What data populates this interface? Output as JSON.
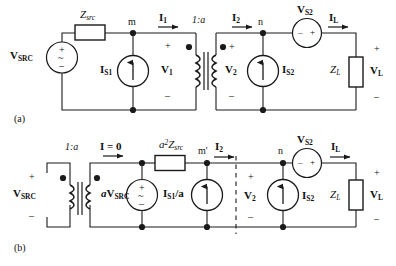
{
  "figure": {
    "type": "circuit-diagram",
    "background_color": "#ffffff",
    "line_color": "#1a1a1a",
    "panels": [
      {
        "caption": "(a)",
        "name": "panel-a",
        "description": "Original two-winding circuit with transformer turns ratio 1:a separating primary and secondary sides"
      },
      {
        "caption": "(b)",
        "name": "panel-b",
        "description": "Referred circuit after reflecting the source side through the 1:a transformer"
      }
    ]
  },
  "panel_a": {
    "caption": "(a)",
    "source_label": "V",
    "source_sub": "SRC",
    "source_symbols": {
      "plus": "+",
      "wave": "~",
      "minus": "–"
    },
    "z_src_label": "Z",
    "z_src_sub": "src",
    "node_m": "m",
    "current_i1": "I",
    "current_i1_sub": "1",
    "is1_label": "I",
    "is1_sub": "S1",
    "v1_label": "V",
    "v1_sub": "1",
    "v1_plus": "+",
    "v1_minus": "–",
    "turns_ratio": "1:a",
    "current_i2": "I",
    "current_i2_sub": "2",
    "v2_label": "V",
    "v2_sub": "2",
    "v2_plus": "+",
    "v2_minus": "–",
    "node_n": "n",
    "is2_label": "I",
    "is2_sub": "S2",
    "vs2_label": "V",
    "vs2_sub": "S2",
    "vs2_minus": "–",
    "vs2_plus": "+",
    "current_il": "I",
    "current_il_sub": "L",
    "zl_label": "Z",
    "zl_sub": "L",
    "vl_label": "V",
    "vl_sub": "L",
    "vl_plus": "+",
    "vl_minus": "–"
  },
  "panel_b": {
    "caption": "(b)",
    "turns_ratio": "1:a",
    "source_label": "V",
    "source_sub": "SRC",
    "source_plus": "+",
    "source_minus": "–",
    "current_i_zero": "I = 0",
    "a_vsrc_prefix": "a",
    "a_vsrc_label": "V",
    "a_vsrc_sub": "SRC",
    "source_symbols": {
      "plus": "+",
      "wave": "~",
      "minus": "–"
    },
    "a2_zsrc_coef": "a",
    "a2_zsrc_exp": "2",
    "a2_zsrc_label": "Z",
    "a2_zsrc_sub": "src",
    "is1_over_a_label": "I",
    "is1_over_a_sub": "S1",
    "is1_over_a_suffix": "/a",
    "node_m_prime": "m'",
    "current_i2": "I",
    "current_i2_sub": "2",
    "v2_label": "V",
    "v2_sub": "2",
    "v2_plus": "+",
    "v2_minus": "–",
    "node_n": "n",
    "is2_label": "I",
    "is2_sub": "S2",
    "vs2_label": "V",
    "vs2_sub": "S2",
    "vs2_minus": "–",
    "vs2_plus": "+",
    "current_il": "I",
    "current_il_sub": "L",
    "zl_label": "Z",
    "zl_sub": "L",
    "vl_label": "V",
    "vl_sub": "L",
    "vl_plus": "+",
    "vl_minus": "–",
    "divider": "dashed-separator"
  }
}
